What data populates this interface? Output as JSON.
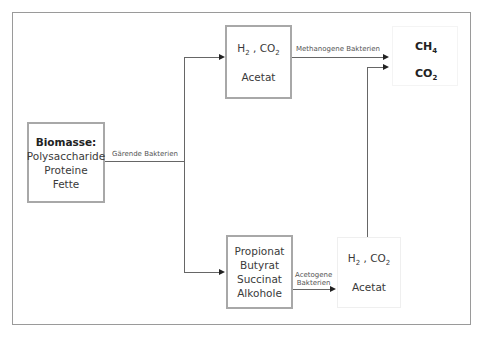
{
  "diagram": {
    "nodes": {
      "biomass": {
        "title": "Biomasse:",
        "lines": [
          "Polysaccharide",
          "Proteine",
          "Fette"
        ]
      },
      "top_intermediate": {
        "h2": "H",
        "h2_sub": "2",
        "sep": " , ",
        "co2": "CO",
        "co2_sub": "2",
        "acetate": "Acetat"
      },
      "acids": {
        "lines": [
          "Propionat",
          "Butyrat",
          "Succinat",
          "Alkohole"
        ]
      },
      "bottom_intermediate": {
        "h2": "H",
        "h2_sub": "2",
        "sep": " , ",
        "co2": "CO",
        "co2_sub": "2",
        "acetate": "Acetat"
      },
      "products": {
        "ch4": "CH",
        "ch4_sub": "4",
        "co2": "CO",
        "co2_sub": "2"
      }
    },
    "edges": {
      "fermenting": "Gärende Bakterien",
      "methanogenic": "Methanogene Bakterien",
      "acetogenic_1": "Acetogene",
      "acetogenic_2": "Bakterien"
    }
  }
}
